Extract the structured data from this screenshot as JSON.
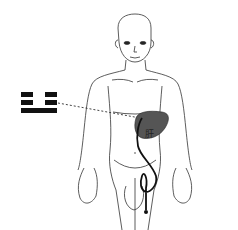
{
  "diagram": {
    "trigram": {
      "name": "zhen-thunder",
      "lines_top_to_bottom": [
        "broken",
        "broken",
        "solid"
      ],
      "color": "#111111"
    },
    "organ_label": "肝",
    "colors": {
      "outline": "#333333",
      "liver_fill": "#555555",
      "meridian": "#111111",
      "connector": "#444444"
    }
  }
}
